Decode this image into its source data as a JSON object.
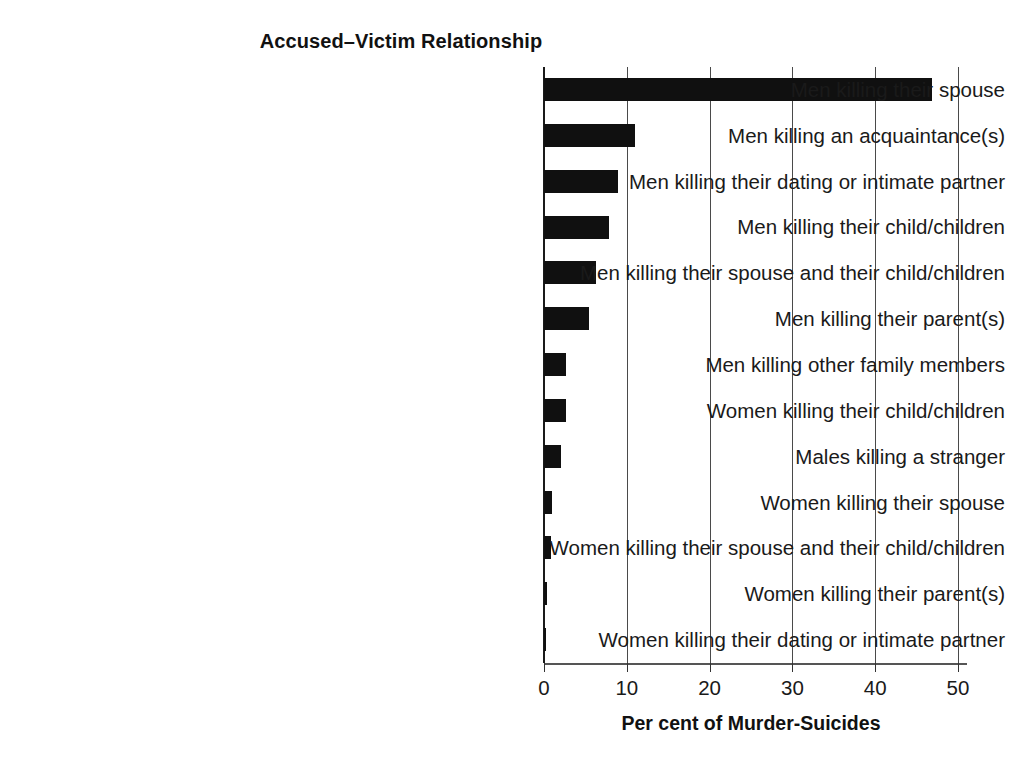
{
  "chart_data": {
    "type": "bar",
    "orientation": "horizontal",
    "title": "Accused–Victim Relationship",
    "xlabel": "Per cent of Murder-Suicides",
    "ylabel": "",
    "xlim": [
      0,
      50
    ],
    "xticks": [
      0,
      10,
      20,
      30,
      40,
      50
    ],
    "grid": true,
    "legend": false,
    "bar_color": "#101010",
    "categories": [
      "Men killing their spouse",
      "Men killing an acquaintance(s)",
      "Men killing their dating or intimate partner",
      "Men killing their child/children",
      "Men killing their spouse and their child/children",
      "Men killing their parent(s)",
      "Men killing other family members",
      "Women killing their child/children",
      "Males killing a stranger",
      "Women killing their spouse",
      "Women killing their spouse and their child/children",
      "Women killing their parent(s)",
      "Women killing their dating or intimate partner"
    ],
    "values": [
      46.8,
      11.0,
      8.9,
      7.9,
      6.3,
      5.4,
      2.7,
      2.7,
      2.0,
      1.0,
      0.8,
      0.4,
      0.3
    ]
  }
}
